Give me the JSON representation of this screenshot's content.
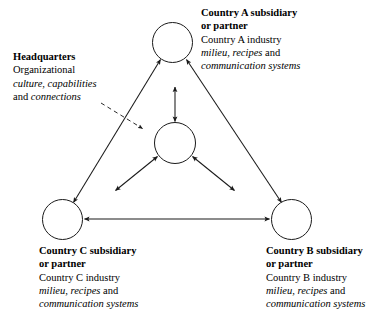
{
  "diagram": {
    "style": {
      "line_color": "#1a1a1a",
      "dashed_line_color": "#4a4a4a",
      "node_fill": "#ffffff",
      "background": "#ffffff"
    },
    "headquarters": {
      "heading": "Headquarters",
      "line2": "Organizational",
      "line3_italic": "culture, capabilities",
      "line4_prefix": "and ",
      "line4_italic": "connections"
    },
    "nodes": [
      {
        "id": "country-a",
        "heading_line1": "Country A subsidiary",
        "heading_line2": "or partner",
        "industry": "Country A industry",
        "terms_italic": "milieu, recipes",
        "terms_conjunction": " and",
        "systems_italic": "communication systems"
      },
      {
        "id": "country-b",
        "heading_line1": "Country B subsidiary",
        "heading_line2": "or partner",
        "industry": "Country B industry",
        "terms_italic": "milieu, recipes",
        "terms_conjunction": " and",
        "systems_italic": "communication systems"
      },
      {
        "id": "country-c",
        "heading_line1": "Country C subsidiary",
        "heading_line2": "or partner",
        "industry": "Country C industry",
        "terms_italic": "milieu, recipes",
        "terms_conjunction": " and",
        "systems_italic": "communication systems"
      },
      {
        "id": "center-hub",
        "heading_line1": "",
        "heading_line2": "",
        "industry": "",
        "terms_italic": "",
        "terms_conjunction": "",
        "systems_italic": ""
      }
    ],
    "connections": [
      {
        "from": "country-c",
        "to": "country-a",
        "style": "solid",
        "heads": "both"
      },
      {
        "from": "country-a",
        "to": "country-b",
        "style": "solid",
        "heads": "both"
      },
      {
        "from": "country-c",
        "to": "country-b",
        "style": "solid",
        "heads": "both"
      },
      {
        "from": "center-hub",
        "to": "country-a",
        "style": "solid",
        "heads": "both"
      },
      {
        "from": "center-hub",
        "to": "country-b",
        "style": "solid",
        "heads": "both"
      },
      {
        "from": "center-hub",
        "to": "country-c",
        "style": "solid",
        "heads": "both"
      },
      {
        "from": "headquarters",
        "to": "center-hub",
        "style": "dashed",
        "heads": "single"
      }
    ]
  }
}
